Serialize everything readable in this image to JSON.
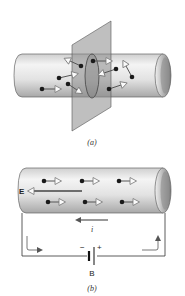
{
  "figure": {
    "panel_a": {
      "caption": "(a)",
      "description": "Cylindrical conductor cut by a plane; charge carriers with random velocity arrows crossing a cross-section"
    },
    "panel_b": {
      "caption": "(b)",
      "field_label": "E",
      "current_label": "i",
      "battery_label": "B",
      "battery_minus": "−",
      "battery_plus": "+",
      "description": "Conductor connected to battery B; electrons drift opposite to field E, current i shown"
    },
    "colors": {
      "cylinder_fill": "#e6e6e6",
      "cylinder_shade": "#9a9a9a",
      "plane_fill": "#8a8a8a",
      "charge": "#1a1a1a",
      "arrow_outline": "#777777",
      "wire": "#333333"
    }
  }
}
